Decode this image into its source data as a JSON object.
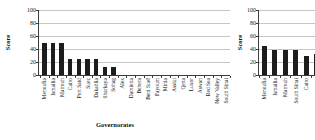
{
  "figure": {
    "description_colors": {
      "bar": "#1d1d1d",
      "gridline": "#c6c6c6",
      "axis": "#3c3c3c",
      "background": "#ffffff"
    }
  },
  "charts": [
    {
      "id": "left",
      "chart_data": {
        "type": "bar",
        "title": "",
        "xlabel": "Governorates",
        "ylabel": "Score",
        "ylim": [
          0,
          100
        ],
        "yticks": [
          0,
          20,
          40,
          60,
          80,
          100
        ],
        "grid": true,
        "legend": false,
        "categories": [
          "Menoufia",
          "Ismailia",
          "Matrouh",
          "Cairo",
          "Port Said",
          "Suez",
          "Dakahlia",
          "Sharkaya",
          "Sohag",
          "Alex",
          "Damietta",
          "Behera",
          "Beni Suef",
          "Fayoum",
          "Minia",
          "Assiut",
          "Qena",
          "Luxor",
          "Aswan",
          "Red Sea",
          "New Valley",
          "South Sinai"
        ],
        "values": [
          50,
          50,
          50,
          25,
          25,
          25,
          25,
          13,
          12,
          0,
          0,
          0,
          0,
          0,
          0,
          0,
          0,
          0,
          0,
          0,
          0,
          0
        ]
      }
    },
    {
      "id": "right",
      "chart_data": {
        "type": "bar",
        "title": "",
        "xlabel": "",
        "ylabel": "Score",
        "ylim": [
          0,
          100
        ],
        "yticks": [
          0,
          20,
          40,
          60,
          80,
          100
        ],
        "grid": true,
        "legend": false,
        "categories": [
          "Menoufia",
          "Ismailia",
          "Matrouh",
          "South Sinai",
          "Cairo",
          ""
        ],
        "values": [
          44,
          38,
          38,
          38,
          30,
          33
        ]
      }
    }
  ]
}
